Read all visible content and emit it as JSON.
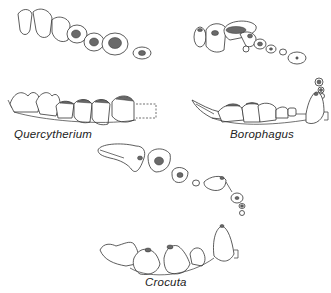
{
  "figure": {
    "panels": [
      {
        "id": "quercytherium",
        "label": "Quercytherium",
        "views": [
          "upper-occlusal",
          "lower-lateral"
        ]
      },
      {
        "id": "borophagus",
        "label": "Borophagus",
        "views": [
          "upper-occlusal",
          "lower-lateral"
        ]
      },
      {
        "id": "crocuta",
        "label": "Crocuta",
        "views": [
          "upper-occlusal",
          "lower-lateral"
        ]
      }
    ]
  }
}
